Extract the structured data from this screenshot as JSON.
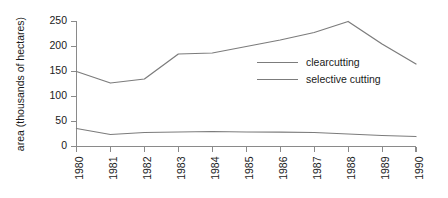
{
  "chart_data": {
    "type": "line",
    "title": "",
    "subtitle": "",
    "xlabel": "",
    "ylabel": "area (thousands of hectares)",
    "x": [
      1980,
      1981,
      1982,
      1983,
      1984,
      1985,
      1986,
      1987,
      1988,
      1989,
      1990
    ],
    "xtick_labels": [
      "1980",
      "1981",
      "1982",
      "1983",
      "1984",
      "1985",
      "1986",
      "1987",
      "1988",
      "1989",
      "1990"
    ],
    "ytick_labels": [
      "0",
      "50",
      "100",
      "150",
      "200",
      "250"
    ],
    "yticks": [
      0,
      50,
      100,
      150,
      200,
      250
    ],
    "ylim": [
      0,
      250
    ],
    "xlim": [
      1980,
      1990
    ],
    "grid": false,
    "legend_position": "center-right-inside",
    "series": [
      {
        "name": "clearcutting",
        "color": "#7c7c7c",
        "values": [
          150,
          127,
          135,
          185,
          187,
          200,
          213,
          228,
          250,
          205,
          165
        ]
      },
      {
        "name": "selective cutting",
        "color": "#7c7c7c",
        "values": [
          36,
          24,
          28,
          29,
          30,
          29,
          29,
          28,
          25,
          22,
          20
        ]
      }
    ],
    "legend_entries": [
      "clearcutting",
      "selective cutting"
    ],
    "axis_color": "#8a8a8a",
    "background_color": "#ffffff"
  }
}
